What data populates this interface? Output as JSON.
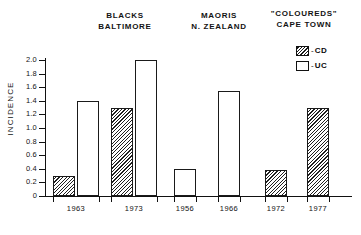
{
  "chart_data": {
    "type": "bar",
    "title": "",
    "xlabel": "",
    "ylabel": "INCIDENCE",
    "ylim": [
      0,
      2.0
    ],
    "ytick_step": 0.2,
    "grid": false,
    "legend_position": "top-right",
    "ytick_labels": [
      "2.0",
      "1.8",
      "1.6",
      "1.4",
      "1.2",
      "1.0",
      "0.8",
      "0.6",
      "0.4",
      "0.2",
      "0"
    ],
    "ytick_values": [
      2.0,
      1.8,
      1.6,
      1.4,
      1.2,
      1.0,
      0.8,
      0.6,
      0.4,
      0.2,
      0
    ],
    "categories": [
      "1963",
      "1973",
      "1956",
      "1966",
      "1972",
      "1977"
    ],
    "series": [
      {
        "name": "CD",
        "values": [
          0.3,
          1.3,
          null,
          null,
          0.38,
          1.3
        ]
      },
      {
        "name": "UC",
        "values": [
          1.4,
          2.0,
          0.4,
          1.55,
          null,
          null
        ]
      }
    ],
    "bars": [
      {
        "category": "1963",
        "series": "CD",
        "value": 0.3,
        "group": "BLACKS BALTIMORE"
      },
      {
        "category": "1963",
        "series": "UC",
        "value": 1.4,
        "group": "BLACKS BALTIMORE"
      },
      {
        "category": "1973",
        "series": "CD",
        "value": 1.3,
        "group": "BLACKS BALTIMORE"
      },
      {
        "category": "1973",
        "series": "UC",
        "value": 2.0,
        "group": "BLACKS BALTIMORE"
      },
      {
        "category": "1956",
        "series": "UC",
        "value": 0.4,
        "group": "MAORIS N. ZEALAND"
      },
      {
        "category": "1966",
        "series": "UC",
        "value": 1.55,
        "group": "MAORIS N. ZEALAND"
      },
      {
        "category": "1972",
        "series": "CD",
        "value": 0.38,
        "group": "\"COLOUREDS\" CAPE TOWN"
      },
      {
        "category": "1977",
        "series": "CD",
        "value": 1.3,
        "group": "\"COLOUREDS\" CAPE TOWN"
      }
    ],
    "groups": [
      {
        "line1": "BLACKS",
        "line2": "BALTIMORE"
      },
      {
        "line1": "MAORIS",
        "line2": "N. ZEALAND"
      },
      {
        "line1": "\"COLOUREDS\"",
        "line2": "CAPE TOWN"
      }
    ],
    "legend": [
      {
        "label": "CD",
        "dash": "-",
        "swatch": "hatched"
      },
      {
        "label": "UC",
        "dash": "-",
        "swatch": "open"
      }
    ],
    "colors": {
      "ink": "#111111",
      "background": "#ffffff",
      "hatch": "#1f1f1f"
    }
  }
}
